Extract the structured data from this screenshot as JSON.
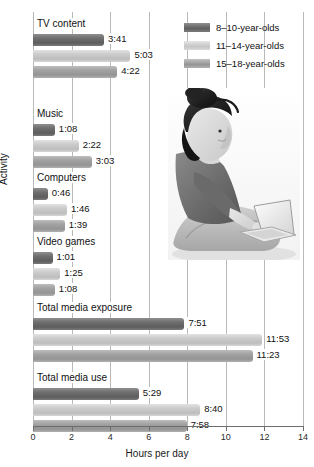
{
  "chart_data": {
    "type": "bar",
    "orientation": "horizontal",
    "title": "",
    "xlabel": "Hours per day",
    "ylabel": "Activity",
    "xlim": [
      0,
      14
    ],
    "xticks": [
      0,
      2,
      4,
      6,
      8,
      10,
      12,
      14
    ],
    "grid": true,
    "legend_position": "top-right",
    "categories": [
      "TV content",
      "Music",
      "Computers",
      "Video games",
      "Total media exposure",
      "Total media use"
    ],
    "series": [
      {
        "name": "8–10-year-olds",
        "color": "#6f6f6f",
        "labels": [
          "3:41",
          "1:08",
          "0:46",
          "1:01",
          "7:51",
          "5:29"
        ],
        "values": [
          3.683,
          1.133,
          0.767,
          1.017,
          7.85,
          5.483
        ]
      },
      {
        "name": "11–14-year-olds",
        "color": "#cccccc",
        "labels": [
          "5:03",
          "2:22",
          "1:46",
          "1:25",
          "11:53",
          "8:40"
        ],
        "values": [
          5.05,
          2.367,
          1.767,
          1.417,
          11.883,
          8.667
        ]
      },
      {
        "name": "15–18-year-olds",
        "color": "#a2a2a2",
        "labels": [
          "4:22",
          "3:03",
          "1:39",
          "1:08",
          "11:23",
          "7:58"
        ],
        "values": [
          4.367,
          3.05,
          1.65,
          1.133,
          11.383,
          7.967
        ]
      }
    ]
  },
  "legend": {
    "items": [
      {
        "label": "8–10-year-olds",
        "shade": "g0"
      },
      {
        "label": "11–14-year-olds",
        "shade": "g1"
      },
      {
        "label": "15–18-year-olds",
        "shade": "g2"
      }
    ]
  },
  "axes": {
    "x_title": "Hours per day",
    "y_title": "Activity",
    "x_tick_labels": [
      "0",
      "2",
      "4",
      "6",
      "8",
      "10",
      "12",
      "14"
    ]
  },
  "photo": {
    "description": "woman-sitting-with-laptop-photo"
  }
}
